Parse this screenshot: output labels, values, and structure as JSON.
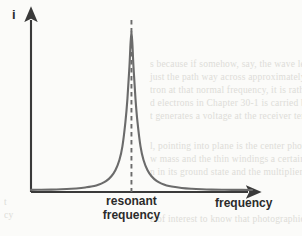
{
  "figure": {
    "name": "resonance-curve-figure",
    "background_color": "#fbfbf9",
    "curve_color": "#6b6b6b",
    "axis_color": "#3a3a3a",
    "label_color": "#2b2b2b"
  },
  "labels": {
    "y_axis": "i",
    "x_axis": "frequency",
    "peak_line1": "resonant",
    "peak_line2": "frequency"
  },
  "ghost": {
    "right": [
      "s because if somehow, say, the wave  length of",
      "just the path way across approximately a whole w",
      "tron at that normal frequency, it is rather easy for the",
      "d electrons in Chapter 30-1 is carried back to the ante",
      "t generates a voltage at the receiver terminals."
    ],
    "lower_right": [
      "l, pointing into plane is the center photomultiplier",
      "w mass and the  thin  windings  a  certain  amount o",
      "n  in  its ground  state  and  the  multiplier  cannot  dis",
      "e of interest to know that photographic  emulsion  related on"
    ],
    "lower_left": [
      "t",
      "cy"
    ]
  },
  "chart_data": {
    "type": "line",
    "title": "",
    "xlabel": "frequency",
    "ylabel": "i",
    "grid": false,
    "legend": null,
    "annotations": [
      {
        "name": "resonant-frequency-marker",
        "text": "resonant frequency",
        "style": "vertical dashed line at curve peak",
        "x": 1.0
      }
    ],
    "axis_arrows": {
      "x": true,
      "y": true
    },
    "axis_ticks": [],
    "xlim": [
      0.0,
      2.2
    ],
    "ylim": [
      0.0,
      1.08
    ],
    "series": [
      {
        "name": "resonance-response",
        "color": "#6b6b6b",
        "x": [
          0.0,
          0.1,
          0.2,
          0.3,
          0.4,
          0.5,
          0.55,
          0.6,
          0.65,
          0.7,
          0.75,
          0.8,
          0.84,
          0.88,
          0.91,
          0.94,
          0.96,
          0.98,
          1.0,
          1.02,
          1.04,
          1.06,
          1.09,
          1.12,
          1.16,
          1.2,
          1.25,
          1.3,
          1.35,
          1.4,
          1.5,
          1.6,
          1.7,
          1.8,
          1.9,
          2.0,
          2.1,
          2.2
        ],
        "y": [
          0.013,
          0.014,
          0.015,
          0.017,
          0.02,
          0.025,
          0.029,
          0.034,
          0.041,
          0.052,
          0.069,
          0.098,
          0.135,
          0.199,
          0.283,
          0.435,
          0.58,
          0.78,
          1.0,
          0.78,
          0.58,
          0.435,
          0.283,
          0.199,
          0.135,
          0.098,
          0.069,
          0.052,
          0.041,
          0.034,
          0.025,
          0.02,
          0.017,
          0.015,
          0.014,
          0.013,
          0.013,
          0.012
        ]
      }
    ]
  }
}
